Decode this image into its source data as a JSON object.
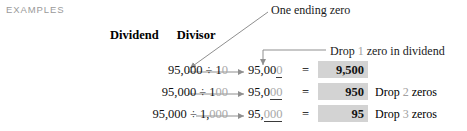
{
  "header": {
    "examples_label": "EXAMPLES"
  },
  "columns": {
    "dividend_heading": "Dividend",
    "divisor_heading": "Divisor"
  },
  "callouts": {
    "one_ending_zero": "One ending zero",
    "drop_zero_prefix": "Drop",
    "drop_zero_count": "1",
    "drop_zero_suffix": "zero in dividend"
  },
  "colors": {
    "examples_label": "#9a9a9a",
    "gray_numeral": "#a0a0a0",
    "result_highlight": "#d3d3d3",
    "leader_line": "#9a9a9a",
    "text": "#111111"
  },
  "rows": [
    {
      "dividend": "95,000",
      "division_sign": "÷",
      "divisor_lead": "1",
      "divisor_zeros": "0",
      "restated_dividend_keep": "95,00",
      "restated_dividend_dropped": "0",
      "equals": "=",
      "result": "9,500",
      "note_prefix": "",
      "note_count": "",
      "note_suffix": ""
    },
    {
      "dividend": "95,000",
      "division_sign": "÷",
      "divisor_lead": "1",
      "divisor_zeros": "00",
      "restated_dividend_keep": "95,0",
      "restated_dividend_dropped": "00",
      "equals": "=",
      "result": "950",
      "note_prefix": "Drop",
      "note_count": "2",
      "note_suffix": "zeros"
    },
    {
      "dividend": "95,000",
      "division_sign": "÷",
      "divisor_lead": "1,",
      "divisor_zeros": "000",
      "restated_dividend_keep": "95,",
      "restated_dividend_dropped": "000",
      "equals": "=",
      "result": "95",
      "note_prefix": "Drop",
      "note_count": "3",
      "note_suffix": "zeros"
    }
  ]
}
